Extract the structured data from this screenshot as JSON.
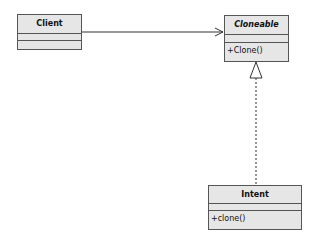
{
  "diagram": {
    "type": "uml-class-diagram",
    "classes": [
      {
        "name": "Client",
        "italic": false,
        "attributes": [],
        "operations": []
      },
      {
        "name": "Cloneable",
        "italic": true,
        "attributes": [],
        "operations": [
          "+Clone()"
        ]
      },
      {
        "name": "Intent",
        "italic": false,
        "attributes": [],
        "operations": [
          "+clone()"
        ]
      }
    ],
    "relationships": [
      {
        "from": "Client",
        "to": "Cloneable",
        "kind": "association",
        "style": "solid-open-arrow"
      },
      {
        "from": "Intent",
        "to": "Cloneable",
        "kind": "realization",
        "style": "dashed-hollow-triangle"
      }
    ],
    "colors": {
      "fill": "#e6e6e6",
      "stroke": "#555555",
      "line": "#333333"
    }
  }
}
